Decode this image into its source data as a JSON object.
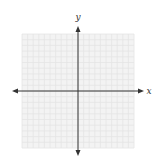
{
  "diagram": {
    "type": "coordinate-plane",
    "x_axis_label": "x",
    "y_axis_label": "y",
    "grid": {
      "cells_per_side": 20,
      "left": 22,
      "top": 34,
      "right": 134,
      "bottom": 148,
      "line_color": "#e4e4e4",
      "background": "#f3f3f3"
    },
    "axes": {
      "origin_x": 78,
      "origin_y": 91,
      "x_start": 12,
      "x_end": 144,
      "y_start": 26,
      "y_end": 156,
      "color": "#333333"
    }
  }
}
